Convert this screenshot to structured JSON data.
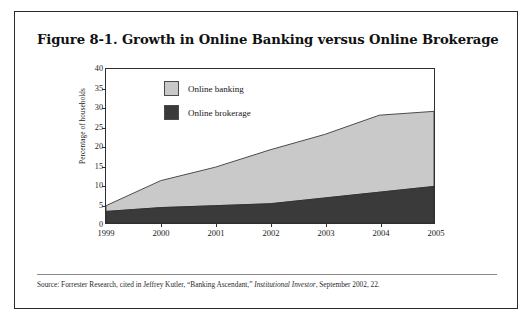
{
  "figure": {
    "title": "Figure 8-1. Growth in Online Banking versus Online Brokerage",
    "source_prefix": "Source: Forrester Research, cited in Jeffrey Kutler, “Banking Ascendant,” ",
    "source_italic": "Institutional Investor",
    "source_suffix": ", September 2002, 22."
  },
  "colors": {
    "online_banking": "#c9c9c9",
    "online_brokerage": "#3a3a3a",
    "axis": "#2f2f2f",
    "border": "#2b2b2b",
    "page_background": "#ffffff"
  },
  "chart_data": {
    "type": "area",
    "stacked": true,
    "title": "Figure 8-1. Growth in Online Banking versus Online Brokerage",
    "xlabel": "",
    "ylabel": "Percentage of households",
    "categories": [
      "1999",
      "2000",
      "2001",
      "2002",
      "2003",
      "2004",
      "2005"
    ],
    "x": [
      1999,
      2000,
      2001,
      2002,
      2003,
      2004,
      2005
    ],
    "ylim": [
      0,
      40
    ],
    "yticks": [
      0,
      5,
      10,
      15,
      20,
      25,
      30,
      35,
      40
    ],
    "grid": false,
    "legend_position": "top-left inside plot",
    "series": [
      {
        "name": "Online banking",
        "color": "#c9c9c9",
        "note": "values are the banking-only increment stacked above brokerage",
        "values": [
          1.5,
          7.0,
          10.0,
          14.0,
          16.5,
          20.0,
          19.5
        ]
      },
      {
        "name": "Online brokerage",
        "color": "#3a3a3a",
        "values": [
          3.0,
          4.0,
          4.5,
          5.0,
          6.5,
          8.0,
          9.5
        ]
      }
    ],
    "cumulative_totals": [
      4.5,
      11.0,
      14.5,
      19.0,
      23.0,
      28.0,
      29.0
    ]
  },
  "legend": {
    "items": [
      {
        "label": "Online banking",
        "color": "#c9c9c9"
      },
      {
        "label": "Online brokerage",
        "color": "#3a3a3a"
      }
    ]
  }
}
